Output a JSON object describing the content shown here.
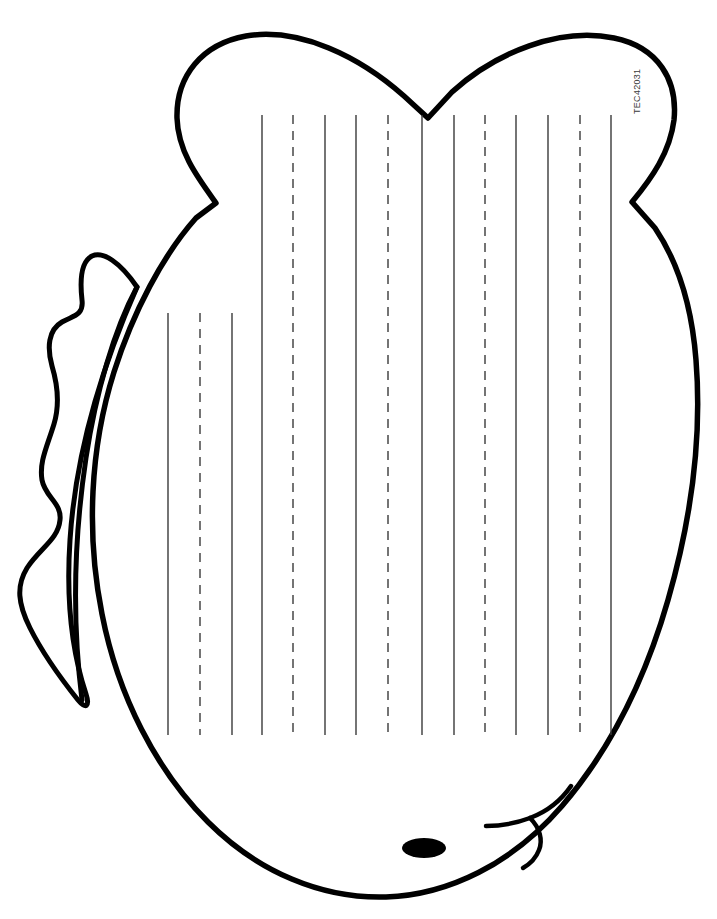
{
  "page": {
    "width": 717,
    "height": 919,
    "background_color": "#ffffff",
    "ink_color": "#000000",
    "rule_color": "#3a3a3a",
    "header_faint_text": "",
    "catalog_code": "TEC42031"
  },
  "artwork": {
    "type": "line-art-printable",
    "subject": "turkey",
    "stroke_color": "#000000",
    "stroke_width": 5,
    "fill_color": "#ffffff",
    "parts": [
      {
        "name": "body-outline",
        "description": "Large rounded turkey body with heart-shaped tail feather top"
      },
      {
        "name": "tail-notch-left",
        "description": "V notch on left side where tail meets body"
      },
      {
        "name": "tail-notch-right",
        "description": "V notch on right side where tail meets body"
      },
      {
        "name": "tail-center-dip",
        "description": "Center dip between the two tail lobes at top"
      },
      {
        "name": "wing",
        "description": "Scalloped wing on the left side of the body"
      },
      {
        "name": "eye",
        "description": "Solid black oval eye near the bottom"
      },
      {
        "name": "beak",
        "description": "Curved beak outline at lower right"
      },
      {
        "name": "snood",
        "description": "Small curved wattle hanging from the beak"
      }
    ]
  },
  "writing_lines": {
    "orientation": "vertical",
    "count": 15,
    "solid_color": "#3a3a3a",
    "dashed_color": "#3a3a3a",
    "stroke_width": 1.4,
    "dash_pattern": "9 7",
    "bottom_y": 735,
    "lines": [
      {
        "index": 1,
        "x": 168,
        "style": "solid",
        "top_y": 313
      },
      {
        "index": 2,
        "x": 200,
        "style": "dashed",
        "top_y": 313
      },
      {
        "index": 3,
        "x": 232,
        "style": "solid",
        "top_y": 313
      },
      {
        "index": 4,
        "x": 262,
        "style": "solid",
        "top_y": 115
      },
      {
        "index": 5,
        "x": 293,
        "style": "dashed",
        "top_y": 115
      },
      {
        "index": 6,
        "x": 325,
        "style": "solid",
        "top_y": 115
      },
      {
        "index": 7,
        "x": 356,
        "style": "solid",
        "top_y": 115
      },
      {
        "index": 8,
        "x": 388,
        "style": "dashed",
        "top_y": 115
      },
      {
        "index": 9,
        "x": 422,
        "style": "solid",
        "top_y": 115
      },
      {
        "index": 10,
        "x": 454,
        "style": "solid",
        "top_y": 115
      },
      {
        "index": 11,
        "x": 485,
        "style": "dashed",
        "top_y": 115
      },
      {
        "index": 12,
        "x": 516,
        "style": "solid",
        "top_y": 115
      },
      {
        "index": 13,
        "x": 548,
        "style": "solid",
        "top_y": 115
      },
      {
        "index": 14,
        "x": 580,
        "style": "dashed",
        "top_y": 115
      },
      {
        "index": 15,
        "x": 611,
        "style": "solid",
        "top_y": 115
      }
    ]
  }
}
